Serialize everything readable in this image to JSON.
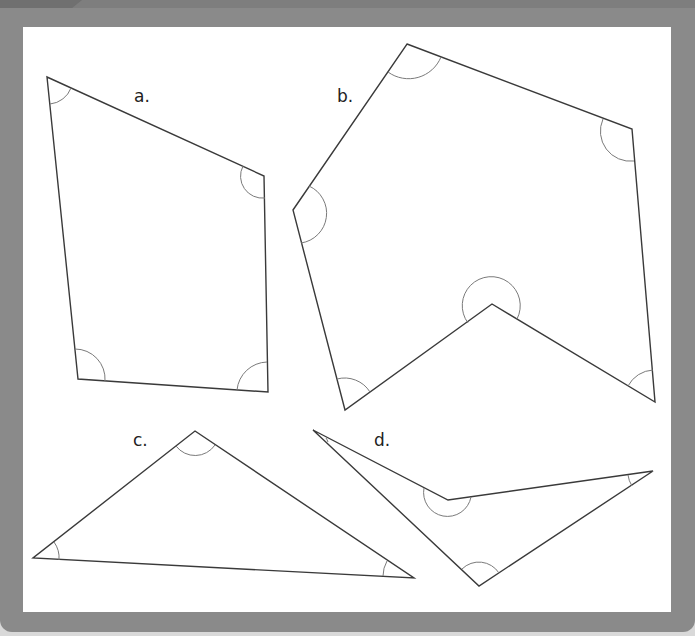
{
  "diagram": {
    "colors": {
      "frame": "#8a8a8a",
      "panel": "#ffffff",
      "stroke": "#3a3a3a",
      "angle_arc": "#7a7a7a"
    },
    "shapes": [
      {
        "id": "a",
        "label": "a.",
        "type": "quadrilateral",
        "vertices": [
          [
            47,
            77
          ],
          [
            264,
            176
          ],
          [
            268,
            392
          ],
          [
            78,
            379
          ]
        ],
        "angle_marks": 4
      },
      {
        "id": "b",
        "label": "b.",
        "type": "concave hexagon",
        "vertices": [
          [
            407,
            44
          ],
          [
            632,
            129
          ],
          [
            655,
            402
          ],
          [
            492,
            304
          ],
          [
            345,
            410
          ],
          [
            293,
            210
          ]
        ],
        "angle_marks": 6
      },
      {
        "id": "c",
        "label": "c.",
        "type": "triangle",
        "vertices": [
          [
            195,
            431
          ],
          [
            414,
            578
          ],
          [
            33,
            558
          ]
        ],
        "angle_marks": 3
      },
      {
        "id": "d",
        "label": "d.",
        "type": "concave quadrilateral",
        "vertices": [
          [
            313,
            430
          ],
          [
            448,
            500
          ],
          [
            653,
            471
          ],
          [
            479,
            586
          ]
        ],
        "angle_marks": 4
      }
    ]
  }
}
